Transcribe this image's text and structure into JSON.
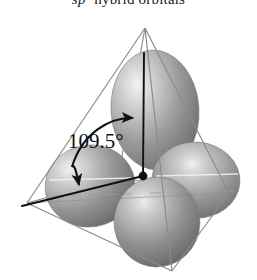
{
  "figure": {
    "title_prefix": "sp",
    "title_superscript": "3",
    "title_rest": " hybrid orbitals",
    "background_color": "#ffffff",
    "width": 257,
    "height": 280
  },
  "annotation": {
    "bond_angle_label": "109.5°",
    "bond_angle_value": 109.5,
    "units": "degrees"
  },
  "geometry": {
    "shape_name": "tetrahedron",
    "vertices": {
      "apex_top": {
        "x": 145,
        "y": 28
      },
      "left": {
        "x": 27,
        "y": 203
      },
      "right": {
        "x": 229,
        "y": 193
      },
      "front_bottom": {
        "x": 172,
        "y": 271
      },
      "back_bottom": {
        "x": 118,
        "y": 178
      }
    },
    "center_atom": {
      "x": 143,
      "y": 176
    },
    "edge_color": "#8c8c8c",
    "edge_width": 1.2
  },
  "orbitals": [
    {
      "name": "orbital-up",
      "label": "upper sp3 lobe",
      "cx": 155,
      "cy": 110,
      "rx": 44,
      "ry": 60,
      "rotate": -4,
      "fill_dark": "#6e6e6e",
      "fill_light": "#cfcfcf",
      "highlight": "#e8e8e8"
    },
    {
      "name": "orbital-left",
      "label": "left sp3 lobe",
      "cx": 90,
      "cy": 186,
      "rx": 45,
      "ry": 41,
      "rotate": -8,
      "fill_dark": "#6b6b6b",
      "fill_light": "#cccccc",
      "highlight": "#ececec"
    },
    {
      "name": "orbital-right",
      "label": "right sp3 lobe",
      "cx": 196,
      "cy": 180,
      "rx": 44,
      "ry": 38,
      "rotate": 4,
      "fill_dark": "#6b6b6b",
      "fill_light": "#cccccc",
      "highlight": "#ececec"
    },
    {
      "name": "orbital-front",
      "label": "front sp3 lobe",
      "cx": 157,
      "cy": 222,
      "rx": 43,
      "ry": 45,
      "rotate": 2,
      "fill_dark": "#656565",
      "fill_light": "#c7c7c7",
      "highlight": "#e4e4e4"
    }
  ],
  "bond_axes": [
    {
      "name": "axis-up",
      "x1": 143,
      "y1": 176,
      "x2": 144,
      "y2": 53
    },
    {
      "name": "axis-left",
      "x1": 143,
      "y1": 176,
      "x2": 22,
      "y2": 206
    }
  ],
  "colors": {
    "ink": "#111111",
    "orbital_gray": "#8a8a8a",
    "wire_gray": "#8c8c8c",
    "paper": "#ffffff"
  }
}
